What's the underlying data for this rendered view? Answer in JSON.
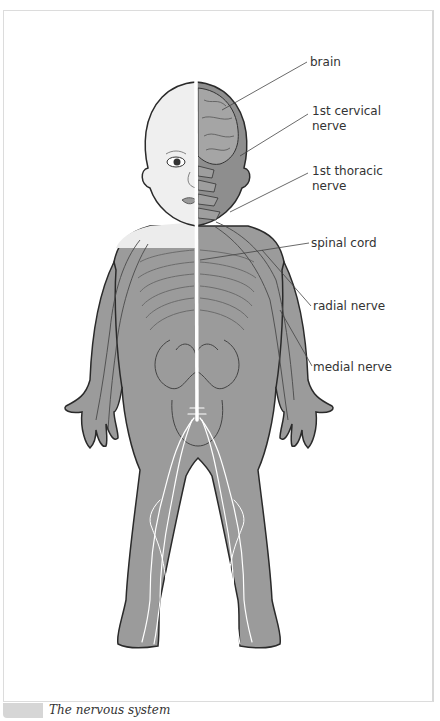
{
  "figure": {
    "colors": {
      "skin_light": "#f2f2f2",
      "body_gray": "#9b9b9b",
      "outline": "#2a2a2a",
      "nerve": "#ffffff",
      "organ_line": "#555555",
      "leader_line": "#444444",
      "frame_border": "#dcdcdc",
      "caption_tab": "#d6d6d6"
    },
    "labels": [
      {
        "id": "brain",
        "lines": [
          "brain"
        ]
      },
      {
        "id": "cervical",
        "lines": [
          "1st cervical",
          "nerve"
        ]
      },
      {
        "id": "thoracic",
        "lines": [
          "1st thoracic",
          "nerve"
        ]
      },
      {
        "id": "spinal",
        "lines": [
          "spinal cord"
        ]
      },
      {
        "id": "radial",
        "lines": [
          "radial nerve"
        ]
      },
      {
        "id": "medial",
        "lines": [
          "medial nerve"
        ]
      }
    ]
  },
  "caption": {
    "text": "The nervous system"
  }
}
